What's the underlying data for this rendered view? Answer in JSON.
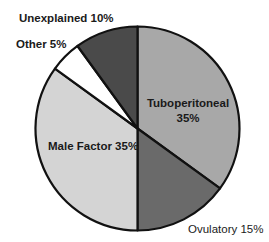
{
  "chart_data": {
    "type": "pie",
    "title": "",
    "start_angle_deg": 0,
    "direction": "clockwise",
    "slices": [
      {
        "label": "Tuboperitoneal",
        "value": 35,
        "color": "#a8a8a8",
        "text_line1": "Tuboperitoneal",
        "text_line2": "35%"
      },
      {
        "label": "Ovulatory",
        "value": 15,
        "color": "#6a6a6a",
        "text_line1": "Ovulatory 15%"
      },
      {
        "label": "Male Factor",
        "value": 35,
        "color": "#d4d4d4",
        "text_line1": "Male Factor 35%"
      },
      {
        "label": "Other",
        "value": 5,
        "color": "#ffffff",
        "text_line1": "Other 5%"
      },
      {
        "label": "Unexplained",
        "value": 10,
        "color": "#4a4a4a",
        "text_line1": "Unexplained 10%"
      }
    ]
  },
  "labels": {
    "tuboperitoneal_1": "Tuboperitoneal",
    "tuboperitoneal_2": "35%",
    "ovulatory": "Ovulatory 15%",
    "male_factor": "Male Factor 35%",
    "other": "Other 5%",
    "unexplained": "Unexplained 10%"
  }
}
